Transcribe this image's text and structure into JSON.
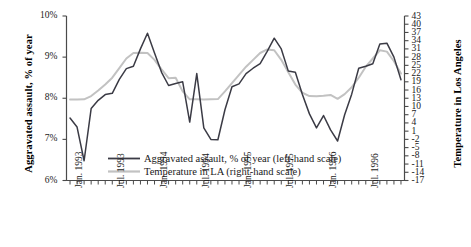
{
  "chart_data": {
    "type": "line",
    "title": "",
    "xlabel": "",
    "ylabel": "Aggravated assault, % of year",
    "y2label": "Temperature in Los Angeles",
    "grid": false,
    "legend_position": "inside-bottom-left",
    "ylim": [
      6,
      10
    ],
    "yticks": [
      "6%",
      "7%",
      "8%",
      "9%",
      "10%"
    ],
    "y2lim": [
      -17,
      43
    ],
    "y2ticks": [
      "43",
      "40",
      "37",
      "34",
      "31",
      "28",
      "25",
      "22",
      "19",
      "16",
      "13",
      "10",
      "7",
      "4",
      "1",
      "-2",
      "-5",
      "-8",
      "-11",
      "-14",
      "-17"
    ],
    "xticks": [
      "Jan. 1993",
      "Jul. 1993",
      "Jan. 1994",
      "Jul. 1994",
      "Jan. 1995",
      "Jul. 1995",
      "Jan. 1996",
      "Jul. 1996"
    ],
    "x_count": 48,
    "series": [
      {
        "name": "Aggravated assault, % of year (left-hand scale)",
        "axis": "left",
        "color": "#3b3b45",
        "values": [
          7.52,
          7.3,
          6.48,
          7.75,
          7.95,
          8.09,
          8.12,
          8.46,
          8.72,
          8.78,
          9.2,
          9.58,
          9.1,
          8.63,
          8.31,
          8.36,
          8.4,
          7.42,
          8.6,
          7.28,
          7.0,
          6.99,
          7.72,
          8.28,
          8.35,
          8.6,
          8.73,
          8.84,
          9.14,
          9.46,
          9.2,
          8.66,
          8.63,
          8.09,
          7.62,
          7.28,
          7.58,
          7.23,
          6.96,
          7.6,
          8.1,
          8.73,
          8.78,
          8.84,
          9.32,
          9.34,
          9.0,
          8.45
        ],
        "note_first_point": "7.52",
        "note_last_point": "7.55"
      },
      {
        "name": "Temperature in LA (right-hand scale)",
        "axis": "right",
        "color": "#c2c2c2",
        "values": [
          12.5,
          12.5,
          12.6,
          13.8,
          15.8,
          18.0,
          20.5,
          24.0,
          27.5,
          29.5,
          29.6,
          29.5,
          27.0,
          23.5,
          20.3,
          20.5,
          15.5,
          12.6,
          12.6,
          12.5,
          12.6,
          12.7,
          15.5,
          18.5,
          21.5,
          24.5,
          27.0,
          29.5,
          30.8,
          30.5,
          27.0,
          22.5,
          18.0,
          15.0,
          13.8,
          13.7,
          13.9,
          14.2,
          12.8,
          14.5,
          17.0,
          20.5,
          24.5,
          27.5,
          30.5,
          30.0,
          26.5,
          22.0
        ]
      }
    ]
  },
  "legend": {
    "items": [
      {
        "label": "Aggravated assault, % of year (left-hand scale)",
        "color": "#3b3b45"
      },
      {
        "label": "Temperature in LA (right-hand scale)",
        "color": "#c2c2c2"
      }
    ]
  },
  "axes": {
    "left_title": "Aggravated assault, % of year",
    "right_title": "Temperature in Los Angeles"
  }
}
